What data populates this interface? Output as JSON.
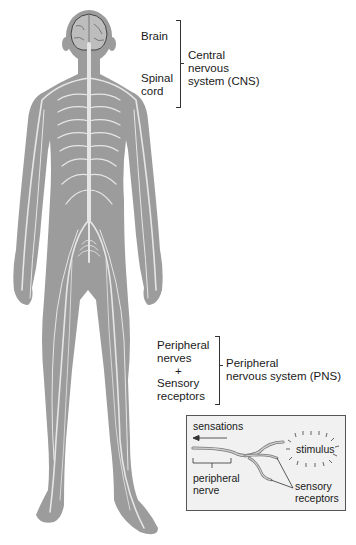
{
  "cns_group": {
    "items": [
      "Brain",
      "Spinal",
      "cord"
    ],
    "label_lines": [
      "Central",
      "nervous",
      "system (CNS)"
    ]
  },
  "pns_group": {
    "items": [
      "Peripheral",
      "nerves",
      "+",
      "Sensory",
      "receptors"
    ],
    "label_lines": [
      "Peripheral",
      "nervous system (PNS)"
    ]
  },
  "inset": {
    "sensations": "sensations",
    "stimulus": "stimulus",
    "peripheral_nerve": [
      "peripheral",
      "nerve"
    ],
    "sensory_receptors": [
      "sensory",
      "receptors"
    ]
  },
  "colors": {
    "body": "#9c9c9c",
    "nerve": "#e6e6e6",
    "brain": "#bdbdbd",
    "text": "#1a1a1a",
    "inset_bg": "#f1f1f1"
  }
}
